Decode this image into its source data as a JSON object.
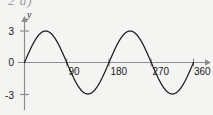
{
  "exercise": {
    "label": "2 a)"
  },
  "colors": {
    "background": "#f4f4f2",
    "curve": "#1a1a1a",
    "axis": "#8d8d8d",
    "text": "#1a1a1a",
    "exercise_label": "#9a9a98"
  },
  "chart_data": {
    "type": "line",
    "title": "",
    "xlabel": "",
    "ylabel": "y",
    "function": "y = 3 sin(2x)",
    "amplitude": 3,
    "period_degrees": 180,
    "xlim": [
      0,
      360
    ],
    "ylim": [
      -3,
      3
    ],
    "grid": false,
    "legend": false,
    "x_tick_labels": [
      "90",
      "180",
      "270",
      "360"
    ],
    "x_ticks": [
      90,
      180,
      270,
      360
    ],
    "y_tick_labels": [
      "3",
      "0",
      "-3"
    ],
    "y_ticks": [
      3,
      0,
      -3
    ],
    "y_axis_label": "y",
    "x": [
      0,
      10,
      20,
      30,
      40,
      45,
      50,
      60,
      70,
      80,
      90,
      100,
      110,
      120,
      130,
      135,
      140,
      150,
      160,
      170,
      180,
      190,
      200,
      210,
      220,
      225,
      230,
      240,
      250,
      260,
      270,
      280,
      290,
      300,
      310,
      315,
      320,
      330,
      340,
      350,
      360
    ],
    "values": [
      0,
      1.026,
      1.928,
      2.598,
      2.954,
      3,
      2.954,
      2.598,
      1.928,
      1.026,
      0,
      -1.026,
      -1.928,
      -2.598,
      -2.954,
      -3,
      -2.954,
      -2.598,
      -1.928,
      -1.026,
      0,
      1.026,
      1.928,
      2.598,
      2.954,
      3,
      2.954,
      2.598,
      1.928,
      1.026,
      0,
      -1.026,
      -1.928,
      -2.598,
      -2.954,
      -3,
      -2.954,
      -2.598,
      -1.928,
      -1.026,
      0
    ],
    "maxima_degrees": [
      45,
      225
    ],
    "minima_degrees": [
      135,
      315
    ],
    "zero_crossings_degrees": [
      0,
      90,
      180,
      270,
      360
    ]
  }
}
